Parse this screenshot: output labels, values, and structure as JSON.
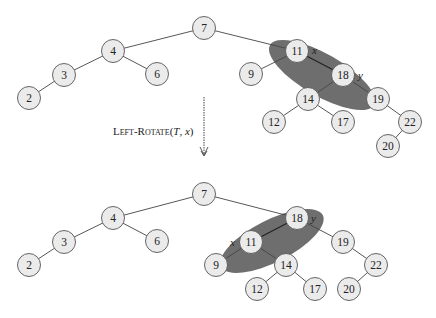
{
  "operation": {
    "name": "Left-Rotate",
    "open": "(",
    "args_T": "T",
    "comma": ", ",
    "args_x": "x",
    "close": ")"
  },
  "labels": {
    "x": "x",
    "y": "y"
  },
  "before": {
    "nodes": [
      "7",
      "4",
      "3",
      "2",
      "6",
      "11",
      "9",
      "18",
      "14",
      "12",
      "17",
      "19",
      "22",
      "20"
    ],
    "highlighted_edge": [
      "11",
      "18"
    ]
  },
  "after": {
    "nodes": [
      "7",
      "4",
      "3",
      "2",
      "6",
      "18",
      "11",
      "9",
      "14",
      "12",
      "17",
      "19",
      "22",
      "20"
    ],
    "highlighted_edge": [
      "18",
      "11"
    ]
  }
}
